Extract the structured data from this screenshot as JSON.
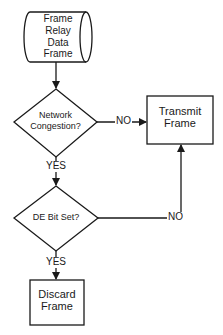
{
  "diagram": {
    "type": "flowchart",
    "colors": {
      "stroke": "#1a1a1a",
      "background": "#ffffff",
      "text": "#1a1a1a"
    },
    "nodes": {
      "start": {
        "shape": "cylinder",
        "lines": [
          "Frame",
          "Relay",
          "Data",
          "Frame"
        ]
      },
      "congestion": {
        "shape": "diamond",
        "lines": [
          "Network",
          "Congestion?"
        ]
      },
      "transmit": {
        "shape": "rectangle",
        "lines": [
          "Transmit",
          "Frame"
        ]
      },
      "de_bit": {
        "shape": "diamond",
        "lines": [
          "DE Bit Set?"
        ]
      },
      "discard": {
        "shape": "rectangle",
        "lines": [
          "Discard",
          "Frame"
        ]
      }
    },
    "edges": [
      {
        "from": "start",
        "to": "congestion",
        "label": ""
      },
      {
        "from": "congestion",
        "to": "transmit",
        "label": "NO"
      },
      {
        "from": "congestion",
        "to": "de_bit",
        "label": "YES"
      },
      {
        "from": "de_bit",
        "to": "transmit",
        "label": "NO"
      },
      {
        "from": "de_bit",
        "to": "discard",
        "label": "YES"
      }
    ]
  }
}
